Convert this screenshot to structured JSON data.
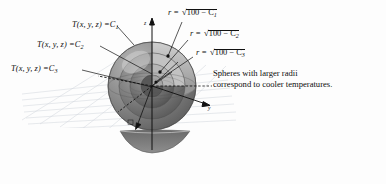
{
  "figure": {
    "background_color": "#fdfdfd",
    "ink_color": "#0d0d0d",
    "sphere_dark": "#6d6d6d",
    "sphere_mid": "#8a8a8a",
    "sphere_light": "#b4b4b4",
    "grid_color": "#c9cfd6"
  },
  "axes": {
    "z_label": "z",
    "y_label": "y",
    "x_label": "x"
  },
  "level_surface_labels": [
    {
      "lhs": "T(x, y, z) =",
      "rhs": "C",
      "sub": "1"
    },
    {
      "lhs": "T(x, y, z) =",
      "rhs": "C",
      "sub": "2"
    },
    {
      "lhs": "T(x, y, z) =",
      "rhs": "C",
      "sub": "3"
    }
  ],
  "radius_labels": [
    {
      "lead": "r =",
      "radicand": "100 − C",
      "sub": "1"
    },
    {
      "lead": "r =",
      "radicand": "100 − C",
      "sub": "2"
    },
    {
      "lead": "r =",
      "radicand": "100 − C",
      "sub": "3"
    }
  ],
  "caption": {
    "line1": "Spheres with larger radii",
    "line2": "correspond to cooler temperatures."
  }
}
